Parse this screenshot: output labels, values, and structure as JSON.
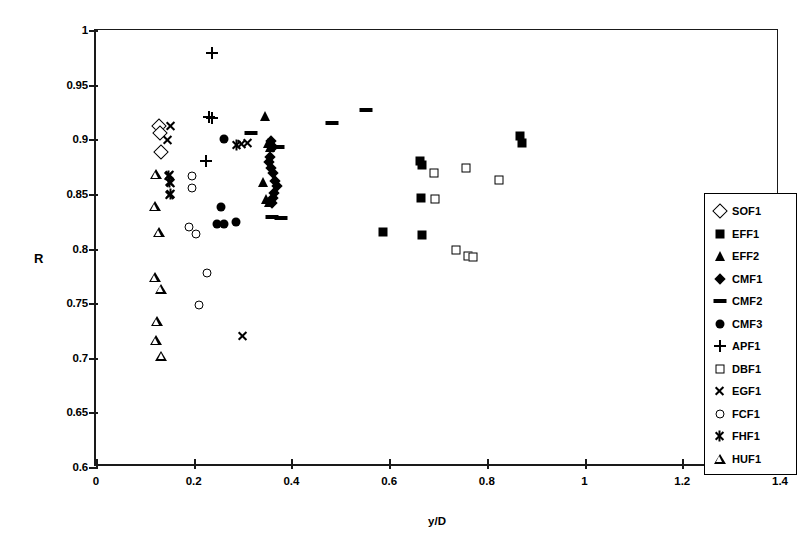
{
  "chart_data": {
    "type": "scatter",
    "title": "",
    "xlabel": "y/D",
    "ylabel": "R",
    "xlim": [
      0,
      1.4
    ],
    "ylim": [
      0.6,
      1
    ],
    "xticks": [
      "0",
      "0.2",
      "0.4",
      "0.6",
      "0.8",
      "1",
      "1.2",
      "1.4"
    ],
    "xtick_values": [
      0,
      0.2,
      0.4,
      0.6,
      0.8,
      1.0,
      1.2,
      1.4
    ],
    "yticks": [
      "0.6",
      "0.65",
      "0.7",
      "0.75",
      "0.8",
      "0.85",
      "0.9",
      "0.95",
      "1"
    ],
    "ytick_values": [
      0.6,
      0.65,
      0.7,
      0.75,
      0.8,
      0.85,
      0.9,
      0.95,
      1.0
    ],
    "grid": false,
    "legend_position": "right-inside",
    "series": [
      {
        "name": "SOF1",
        "marker": "diamond-open",
        "points": [
          [
            0.128,
            0.912
          ],
          [
            0.131,
            0.906
          ],
          [
            0.133,
            0.888
          ]
        ]
      },
      {
        "name": "EFF1",
        "marker": "square-filled",
        "points": [
          [
            0.663,
            0.88
          ],
          [
            0.668,
            0.876
          ],
          [
            0.665,
            0.846
          ],
          [
            0.668,
            0.812
          ],
          [
            0.588,
            0.815
          ],
          [
            0.868,
            0.903
          ],
          [
            0.871,
            0.897
          ],
          [
            1.302,
            0.815
          ]
        ]
      },
      {
        "name": "EFF2",
        "marker": "triangle-filled",
        "points": [
          [
            0.345,
            0.921
          ],
          [
            0.352,
            0.897
          ],
          [
            0.356,
            0.893
          ],
          [
            0.341,
            0.861
          ],
          [
            0.347,
            0.845
          ],
          [
            0.355,
            0.843
          ]
        ]
      },
      {
        "name": "CMF1",
        "marker": "diamond-filled",
        "points": [
          [
            0.358,
            0.898
          ],
          [
            0.362,
            0.893
          ],
          [
            0.357,
            0.884
          ],
          [
            0.354,
            0.879
          ],
          [
            0.358,
            0.874
          ],
          [
            0.362,
            0.869
          ],
          [
            0.367,
            0.862
          ],
          [
            0.37,
            0.857
          ],
          [
            0.365,
            0.851
          ],
          [
            0.362,
            0.846
          ],
          [
            0.36,
            0.842
          ]
        ]
      },
      {
        "name": "CMF2",
        "marker": "dash",
        "points": [
          [
            0.318,
            0.906
          ],
          [
            0.372,
            0.893
          ],
          [
            0.483,
            0.915
          ],
          [
            0.553,
            0.927
          ],
          [
            0.36,
            0.829
          ],
          [
            0.378,
            0.828
          ]
        ]
      },
      {
        "name": "CMF3",
        "marker": "circle-filled",
        "points": [
          [
            0.262,
            0.9
          ],
          [
            0.256,
            0.838
          ],
          [
            0.261,
            0.822
          ],
          [
            0.286,
            0.824
          ],
          [
            0.247,
            0.822
          ]
        ]
      },
      {
        "name": "APF1",
        "marker": "plus",
        "points": [
          [
            0.238,
            0.979
          ],
          [
            0.232,
            0.92
          ],
          [
            0.237,
            0.919
          ],
          [
            0.226,
            0.88
          ]
        ]
      },
      {
        "name": "DBF1",
        "marker": "square-open",
        "points": [
          [
            0.692,
            0.869
          ],
          [
            0.694,
            0.845
          ],
          [
            0.757,
            0.874
          ],
          [
            0.824,
            0.863
          ],
          [
            0.736,
            0.799
          ],
          [
            0.762,
            0.793
          ],
          [
            0.771,
            0.792
          ]
        ]
      },
      {
        "name": "EGF1",
        "marker": "cross",
        "points": [
          [
            0.152,
            0.912
          ],
          [
            0.146,
            0.899
          ],
          [
            0.15,
            0.867
          ],
          [
            0.152,
            0.86
          ],
          [
            0.151,
            0.849
          ],
          [
            0.3,
            0.72
          ],
          [
            0.297,
            0.896
          ],
          [
            0.31,
            0.897
          ]
        ]
      },
      {
        "name": "FCF1",
        "marker": "circle-open",
        "points": [
          [
            0.197,
            0.866
          ],
          [
            0.197,
            0.855
          ],
          [
            0.19,
            0.82
          ],
          [
            0.205,
            0.813
          ],
          [
            0.21,
            0.748
          ],
          [
            0.228,
            0.778
          ]
        ]
      },
      {
        "name": "FHF1",
        "marker": "star6",
        "points": [
          [
            0.148,
            0.866
          ],
          [
            0.15,
            0.861
          ],
          [
            0.152,
            0.85
          ],
          [
            0.287,
            0.895
          ]
        ]
      },
      {
        "name": "HUF1",
        "marker": "triangle-open",
        "points": [
          [
            0.123,
            0.868
          ],
          [
            0.121,
            0.848
          ],
          [
            0.129,
            0.833
          ],
          [
            0.12,
            0.801
          ],
          [
            0.133,
            0.8
          ],
          [
            0.124,
            0.779
          ],
          [
            0.122,
            0.771
          ],
          [
            0.134,
            0.766
          ]
        ]
      }
    ]
  },
  "legend": {
    "entries": [
      {
        "label": "SOF1",
        "marker": "diamond-open"
      },
      {
        "label": "EFF1",
        "marker": "square-filled"
      },
      {
        "label": "EFF2",
        "marker": "triangle-filled"
      },
      {
        "label": "CMF1",
        "marker": "diamond-filled"
      },
      {
        "label": "CMF2",
        "marker": "dash"
      },
      {
        "label": "CMF3",
        "marker": "circle-filled"
      },
      {
        "label": "APF1",
        "marker": "plus"
      },
      {
        "label": "DBF1",
        "marker": "square-open"
      },
      {
        "label": "EGF1",
        "marker": "cross"
      },
      {
        "label": "FCF1",
        "marker": "circle-open"
      },
      {
        "label": "FHF1",
        "marker": "star6"
      },
      {
        "label": "HUF1",
        "marker": "triangle-open"
      }
    ]
  },
  "colors": {
    "marker": "#000000",
    "axis": "#1a1a1a",
    "background": "#ffffff"
  }
}
